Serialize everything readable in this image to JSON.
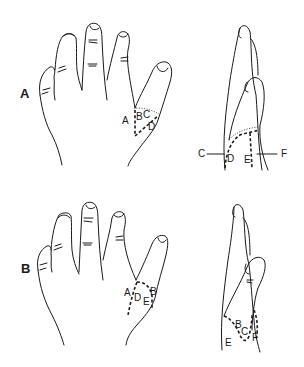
{
  "figure": {
    "panels": [
      {
        "id": "A",
        "label": "A",
        "dorsal_labels": [
          "A",
          "B",
          "C",
          "D"
        ],
        "lateral_labels": [
          "C",
          "D",
          "E",
          "F"
        ]
      },
      {
        "id": "B",
        "label": "B",
        "dorsal_labels": [
          "A",
          "B",
          "D",
          "E"
        ],
        "lateral_labels": [
          "B",
          "C",
          "E",
          "F"
        ]
      }
    ]
  }
}
